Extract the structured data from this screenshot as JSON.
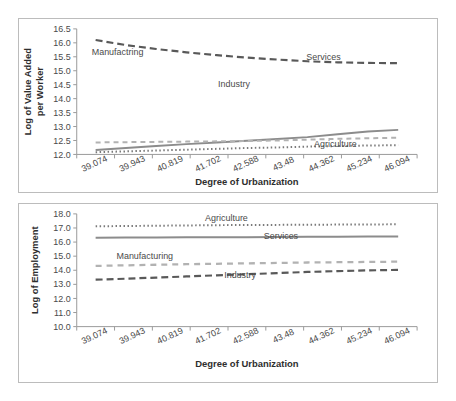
{
  "figure": {
    "background_color": "#ffffff",
    "panel_border_color": "#bcbcbc",
    "axis_color": "#9a9a9a"
  },
  "chart_data": [
    {
      "id": "value-added-chart",
      "type": "line",
      "title": "",
      "xlabel": "Degree of Urbanization",
      "ylabel": "Log of Value Added per Worker",
      "ylabel_line1": "Log of Value Added",
      "ylabel_line2": "per Worker",
      "categories": [
        "39.074",
        "39.943",
        "40.819",
        "41.702",
        "42.588",
        "43.48",
        "44.362",
        "45.234",
        "46.094"
      ],
      "yticks": [
        "12.0",
        "12.5",
        "13.0",
        "13.5",
        "14.0",
        "14.5",
        "15.0",
        "15.5",
        "16.0",
        "16.5"
      ],
      "ylim": [
        12.0,
        16.5
      ],
      "grid": false,
      "legend_position": "inline-labels",
      "series": [
        {
          "name": "Industry",
          "style": "dashed",
          "color": "#595959",
          "width": 2.2,
          "dash": "7,4",
          "label_x": 46.2,
          "label_y": 46.5,
          "values": [
            16.1,
            15.92,
            15.78,
            15.66,
            15.56,
            15.47,
            15.4,
            15.34,
            15.3,
            15.28,
            15.27
          ]
        },
        {
          "name": "Services",
          "style": "solid",
          "color": "#8c8c8c",
          "width": 2.0,
          "dash": "",
          "label_x": 72.5,
          "label_y": 24.5,
          "values": [
            12.16,
            12.23,
            12.3,
            12.37,
            12.43,
            12.49,
            12.55,
            12.62,
            12.72,
            12.82,
            12.88
          ]
        },
        {
          "name": "Manufactring",
          "style": "dashed-short",
          "color": "#b2b2b2",
          "width": 2.0,
          "dash": "5,4",
          "label_x": 12.0,
          "label_y": 21.0,
          "values": [
            12.43,
            12.44,
            12.45,
            12.46,
            12.47,
            12.48,
            12.5,
            12.53,
            12.56,
            12.58,
            12.6
          ]
        },
        {
          "name": "Agriculture",
          "style": "dotted",
          "color": "#7a7a7a",
          "width": 2.0,
          "dash": "1.5,2.5",
          "label_x": 76.0,
          "label_y": 94.0,
          "values": [
            12.08,
            12.11,
            12.14,
            12.17,
            12.2,
            12.23,
            12.25,
            12.28,
            12.3,
            12.32,
            12.33
          ]
        }
      ]
    },
    {
      "id": "employment-chart",
      "type": "line",
      "title": "",
      "xlabel": "Degree of Urbanization",
      "ylabel": "Log of Employment",
      "ylabel_line1": "Log of Employment",
      "ylabel_line2": "",
      "categories": [
        "39.074",
        "39.943",
        "40.819",
        "41.702",
        "42.588",
        "43.48",
        "44.362",
        "45.234",
        "46.094"
      ],
      "yticks": [
        "10.0",
        "11.0",
        "12.0",
        "13.0",
        "14.0",
        "15.0",
        "16.0",
        "17.0",
        "18.0"
      ],
      "ylim": [
        10.0,
        18.0
      ],
      "grid": false,
      "legend_position": "inline-labels",
      "series": [
        {
          "name": "Agriculture",
          "style": "dotted",
          "color": "#7a7a7a",
          "width": 2.0,
          "dash": "1.5,2.5",
          "label_x": 44.0,
          "label_y": 6.0,
          "values": [
            17.12,
            17.14,
            17.16,
            17.18,
            17.2,
            17.21,
            17.22,
            17.23,
            17.24,
            17.25,
            17.26
          ]
        },
        {
          "name": "Services",
          "style": "solid",
          "color": "#8c8c8c",
          "width": 2.0,
          "dash": "",
          "label_x": 60.0,
          "label_y": 22.0,
          "values": [
            16.31,
            16.32,
            16.33,
            16.34,
            16.34,
            16.35,
            16.36,
            16.37,
            16.38,
            16.39,
            16.4
          ]
        },
        {
          "name": "Manufacturing",
          "style": "dashed-short",
          "color": "#b2b2b2",
          "width": 2.3,
          "dash": "6,5",
          "label_x": 20.0,
          "label_y": 40.0,
          "values": [
            14.31,
            14.35,
            14.39,
            14.43,
            14.46,
            14.49,
            14.52,
            14.55,
            14.57,
            14.59,
            14.61
          ]
        },
        {
          "name": "Industry",
          "style": "dashed",
          "color": "#595959",
          "width": 2.2,
          "dash": "7,4",
          "label_x": 48.0,
          "label_y": 57.0,
          "values": [
            13.33,
            13.4,
            13.48,
            13.56,
            13.64,
            13.72,
            13.8,
            13.88,
            13.94,
            13.99,
            14.03
          ]
        }
      ]
    }
  ]
}
